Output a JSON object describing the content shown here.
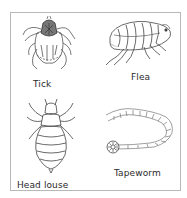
{
  "figure": {
    "panels": [
      {
        "id": "tick",
        "label": "Tick",
        "icon": "tick-illustration"
      },
      {
        "id": "flea",
        "label": "Flea",
        "icon": "flea-illustration"
      },
      {
        "id": "head-louse",
        "label": "Head louse",
        "icon": "head-louse-illustration"
      },
      {
        "id": "tapeworm",
        "label": "Tapeworm",
        "icon": "tapeworm-illustration"
      }
    ],
    "border_color": "#b8b8b8",
    "line_color": "#555555"
  }
}
